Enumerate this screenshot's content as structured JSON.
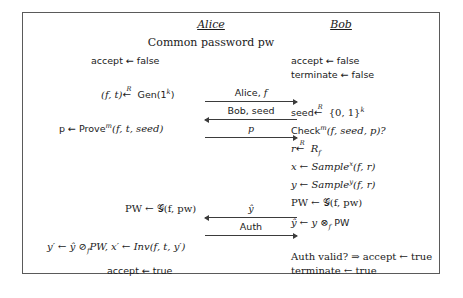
{
  "figure": {
    "parties": {
      "left": "Alice",
      "right": "Bob"
    },
    "common_line": "Common password pw",
    "left_column": {
      "init_accept": "accept ← false",
      "keygen_prefix": "(f, t)",
      "keygen_suffix": "Gen(1",
      "keygen_exp": "k",
      "keygen_close": ")",
      "prove": "p ← Prove",
      "prove_exp": "m",
      "prove_args": "(f, t, seed)",
      "pw_assign": "PW ← 𝒢(f, pw)",
      "final_compute": "y′ ← ŷ ⊘",
      "final_compute_sub": "f",
      "final_compute_rest": "PW, x′ ← Inv(f, t, y′)",
      "accept_true": "accept ← true"
    },
    "right_column": {
      "init_accept": "accept ← false",
      "init_terminate": "terminate ← false",
      "seed_assign_prefix": "seed",
      "seed_assign_suffix": "{0, 1}",
      "seed_assign_exp": "k",
      "check": "Check",
      "check_exp": "m",
      "check_args": "(f, seed, p)?",
      "r_assign_prefix": "r",
      "r_assign_suffix": "R",
      "r_assign_sub": "f",
      "x_assign": "x ← Sample",
      "x_assign_exp": "x",
      "x_assign_args": "(f, r)",
      "y_assign": "y ← Sample",
      "y_assign_exp": "y",
      "y_assign_args": "(f, r)",
      "pw_assign": "PW ← 𝒢(f, pw)",
      "yhat_assign": "ŷ ← y ⊗",
      "yhat_assign_sub": "f",
      "yhat_assign_rest": "PW",
      "auth_check": "Auth valid? ⇒ accept ← true",
      "terminate_true": "terminate ← true"
    },
    "messages": [
      {
        "label": "Alice, f",
        "direction": "right"
      },
      {
        "label": "Bob, seed",
        "direction": "left"
      },
      {
        "label": "p",
        "direction": "right"
      },
      {
        "label": "ŷ",
        "direction": "left"
      },
      {
        "label": "Auth",
        "direction": "right"
      }
    ],
    "colors": {
      "border": "#5a5a5a",
      "text": "#1a1a1a",
      "arrow": "#3b3b3b",
      "background": "#ffffff"
    }
  }
}
